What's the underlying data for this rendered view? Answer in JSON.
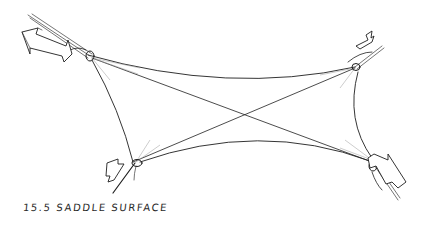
{
  "figure": {
    "caption": "15.5  SADDLE SURFACE",
    "corners": [
      {
        "position": "top-left",
        "label": "high-point-anchor-with-tension-arrow"
      },
      {
        "position": "top-right",
        "label": "high-point-anchor-with-tension-arrow"
      },
      {
        "position": "bottom-left",
        "label": "low-point-anchor-with-tension-arrow"
      },
      {
        "position": "bottom-right",
        "label": "low-point-anchor-with-tension-arrow"
      }
    ],
    "colors": {
      "ink": "#1e1e1e",
      "background": "#ffffff"
    }
  }
}
